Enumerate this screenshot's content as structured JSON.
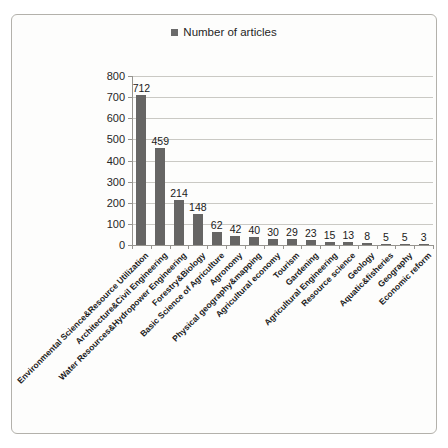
{
  "figure": {
    "kind": "scanned bar chart figure",
    "frame_border_color": "#b3b1ab",
    "page_background": "#ffffff",
    "frame_background": "#fdfdfc"
  },
  "chart_data": {
    "type": "bar",
    "title": "",
    "legend_label": "Number of articles",
    "legend_position": "top-center",
    "grid": "horizontal",
    "bar_color": "#666564",
    "legend_swatch_color": "#6a6a6a",
    "axis_color": "#96948f",
    "gridline_color": "#cac9c4",
    "value_labels_shown": true,
    "x_tick_label_rotation_deg": 45,
    "xlabel": "",
    "ylabel": "",
    "ylim": [
      0,
      800
    ],
    "yticks": [
      0,
      100,
      200,
      300,
      400,
      500,
      600,
      700,
      800
    ],
    "categories": [
      "Environmental Science&Resource Utilization",
      "Architecture&Civil Engineering",
      "Water Resources&Hydropower Engineering",
      "Forestry&Biology",
      "Basic Science of Agriculture",
      "Agronomy",
      "Physical geography&mapping",
      "Agricultural economy",
      "Tourism",
      "Gardening",
      "Agricultural Engineering",
      "Resource science",
      "Geology",
      "Aquatic&fisheries",
      "Geography",
      "Economic reform"
    ],
    "values": [
      712,
      459,
      214,
      148,
      62,
      42,
      40,
      30,
      29,
      23,
      15,
      13,
      8,
      5,
      5,
      3
    ]
  }
}
